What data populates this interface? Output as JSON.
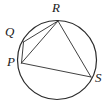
{
  "figure": {
    "name": "circle-with-inscribed-chords",
    "caption": "",
    "stroke_color": "#2b2b2b",
    "label_color": "#1b1b1b",
    "background_color": "#ffffff",
    "circle": {
      "cx": 57,
      "cy": 60,
      "r": 39.5,
      "stroke_width": 1.2
    },
    "points": [
      {
        "id": "P",
        "label": "P",
        "x": 21.5,
        "y": 63.0,
        "label_x": 7,
        "label_y": 55
      },
      {
        "id": "Q",
        "label": "Q",
        "x": 23.5,
        "y": 42.0,
        "label_x": 5,
        "label_y": 25
      },
      {
        "id": "R",
        "label": "R",
        "x": 58.0,
        "y": 21.0,
        "label_x": 52,
        "label_y": 1
      },
      {
        "id": "S",
        "label": "S",
        "x": 91.0,
        "y": 77.0,
        "label_x": 95,
        "label_y": 71
      }
    ],
    "chords": [
      {
        "id": "QR",
        "from": "Q",
        "to": "R",
        "stroke_width": 0.9
      },
      {
        "id": "QP",
        "from": "Q",
        "to": "P",
        "stroke_width": 0.9
      },
      {
        "id": "PR",
        "from": "P",
        "to": "R",
        "stroke_width": 0.9
      },
      {
        "id": "RS",
        "from": "R",
        "to": "S",
        "stroke_width": 0.9
      },
      {
        "id": "PS",
        "from": "P",
        "to": "S",
        "stroke_width": 0.9
      }
    ]
  },
  "chart_data": {
    "type": "diagram",
    "title": "",
    "shape": "circle",
    "labels": [
      "P",
      "Q",
      "R",
      "S"
    ],
    "segments": [
      "QR",
      "QP",
      "PR",
      "RS",
      "PS"
    ]
  }
}
